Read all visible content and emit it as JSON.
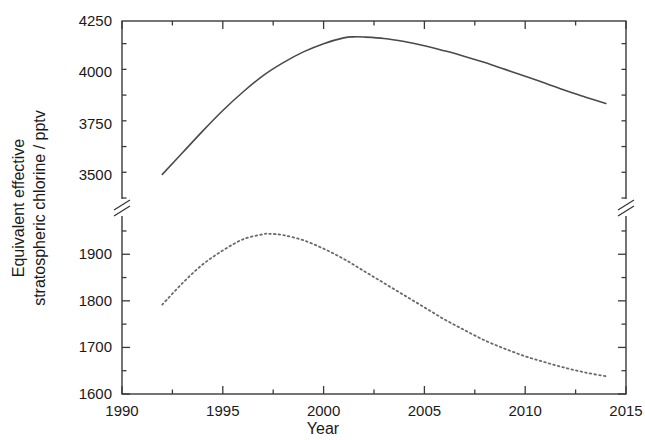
{
  "chart_data": {
    "type": "line",
    "title": "",
    "xlabel": "Year",
    "ylabel": "Equivalent effective stratospheric chlorine / pptv",
    "ylabel_line1": "Equivalent effective",
    "ylabel_line2": "stratospheric chlorine / pptv",
    "xlim": [
      1990,
      2015
    ],
    "xticks": [
      1990,
      1995,
      2000,
      2005,
      2010,
      2015
    ],
    "xtick_labels": [
      "1990",
      "1995",
      "2000",
      "2005",
      "2010",
      "2015"
    ],
    "x_minor_interval": 2.5,
    "grid": false,
    "legend": "none",
    "axis_break": {
      "present": true,
      "upper_range": [
        3400,
        4250
      ],
      "lower_range": [
        1600,
        1975
      ],
      "note": "broken y-axis between lower and upper panels"
    },
    "yaxis_upper": {
      "ticks": [
        3500,
        3750,
        4000,
        4250
      ],
      "tick_labels": [
        "3500",
        "3750",
        "4000",
        "4250"
      ],
      "minor_interval": 125,
      "ylim": [
        3390,
        4250
      ]
    },
    "yaxis_lower": {
      "ticks": [
        1600,
        1700,
        1800,
        1900
      ],
      "tick_labels": [
        "1600",
        "1700",
        "1800",
        "1900"
      ],
      "minor_interval": 50,
      "ylim": [
        1600,
        1980
      ]
    },
    "series": [
      {
        "name": "upper-curve",
        "style": "solid",
        "color": "#4a4a4a",
        "panel": "upper",
        "x": [
          1992.0,
          1993.0,
          1994.0,
          1995.0,
          1996.0,
          1997.0,
          1998.0,
          1999.0,
          2000.0,
          2001.0,
          2001.5,
          2002.0,
          2003.0,
          2004.0,
          2005.0,
          2006.0,
          2007.0,
          2008.0,
          2009.0,
          2010.0,
          2011.0,
          2012.0,
          2013.0,
          2014.0
        ],
        "y": [
          3505,
          3610,
          3715,
          3815,
          3905,
          3985,
          4048,
          4100,
          4140,
          4168,
          4173,
          4172,
          4165,
          4150,
          4130,
          4105,
          4078,
          4048,
          4015,
          3982,
          3948,
          3912,
          3880,
          3849
        ]
      },
      {
        "name": "lower-curve",
        "style": "dotted",
        "color": "#6a6a6a",
        "panel": "lower",
        "x": [
          1992.0,
          1993.0,
          1994.0,
          1995.0,
          1996.0,
          1997.0,
          1997.3,
          1998.0,
          1999.0,
          2000.0,
          2001.0,
          2002.0,
          2003.0,
          2004.0,
          2005.0,
          2006.0,
          2007.0,
          2008.0,
          2009.0,
          2010.0,
          2011.0,
          2012.0,
          2013.0,
          2014.0
        ],
        "y": [
          1792,
          1838,
          1878,
          1908,
          1932,
          1943,
          1944,
          1941,
          1930,
          1912,
          1890,
          1864,
          1838,
          1812,
          1786,
          1760,
          1737,
          1715,
          1697,
          1681,
          1668,
          1656,
          1646,
          1638
        ]
      }
    ]
  }
}
